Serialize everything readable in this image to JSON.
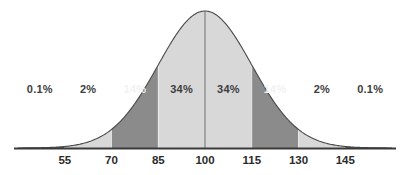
{
  "chart_data": {
    "type": "area",
    "title": "",
    "subtitle": "",
    "xlabel": "",
    "ylabel": "",
    "grid": false,
    "legend": "none",
    "distribution": "normal",
    "mean": 100,
    "std_dev": 15,
    "xlim": [
      40,
      160
    ],
    "ylim": [
      0,
      1
    ],
    "x_ticks": [
      55,
      70,
      85,
      100,
      115,
      130,
      145
    ],
    "x_tick_labels": [
      "55",
      "70",
      "85",
      "100",
      "115",
      "130",
      "145"
    ],
    "center_line_at": 100,
    "bands": [
      {
        "label": "0.1%",
        "from": 40,
        "to": 55,
        "value": 0.1,
        "shade": "dark",
        "text_color": "dark",
        "label_x": 47,
        "label_outside": true
      },
      {
        "label": "2%",
        "from": 55,
        "to": 70,
        "value": 2,
        "shade": "light",
        "text_color": "dark",
        "label_x": 62.5,
        "label_outside": true
      },
      {
        "label": "14%",
        "from": 70,
        "to": 85,
        "value": 14,
        "shade": "medium",
        "text_color": "light",
        "label_x": 77.5,
        "label_outside": false
      },
      {
        "label": "34%",
        "from": 85,
        "to": 100,
        "value": 34,
        "shade": "light",
        "text_color": "dark",
        "label_x": 92.5,
        "label_outside": false
      },
      {
        "label": "34%",
        "from": 100,
        "to": 115,
        "value": 34,
        "shade": "light",
        "text_color": "dark",
        "label_x": 107.5,
        "label_outside": false
      },
      {
        "label": "14%",
        "from": 115,
        "to": 130,
        "value": 14,
        "shade": "medium",
        "text_color": "light",
        "label_x": 122.5,
        "label_outside": false
      },
      {
        "label": "2%",
        "from": 130,
        "to": 145,
        "value": 2,
        "shade": "light",
        "text_color": "dark",
        "label_x": 137.5,
        "label_outside": true
      },
      {
        "label": "0.1%",
        "from": 145,
        "to": 160,
        "value": 0.1,
        "shade": "dark",
        "text_color": "dark",
        "label_x": 153,
        "label_outside": true
      }
    ],
    "colors": {
      "light": "#d8d8d8",
      "medium": "#8b8b8b",
      "dark": "#585858",
      "outline": "#4a4a4a",
      "baseline": "#3a3a3a",
      "background": "#ffffff",
      "label_dark": "#3d3d3d",
      "label_light": "#f2f2f2"
    }
  }
}
